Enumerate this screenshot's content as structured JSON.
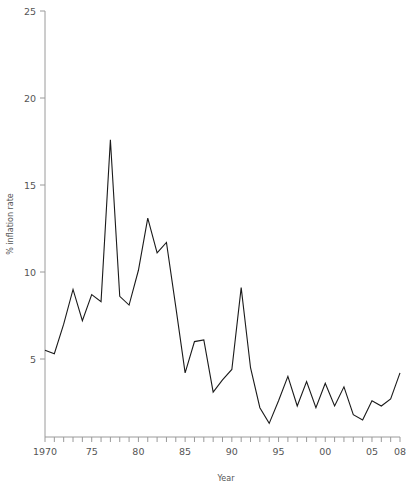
{
  "chart_data": {
    "type": "line",
    "title": "",
    "xlabel": "Year",
    "ylabel": "% inflation rate",
    "xlim": [
      1970,
      2008
    ],
    "ylim": [
      0.5,
      25
    ],
    "grid": false,
    "legend": null,
    "x_tick_values": [
      1970,
      1975,
      1980,
      1985,
      1990,
      1995,
      2000,
      2005,
      2008
    ],
    "x_tick_labels": [
      "1970",
      "75",
      "80",
      "85",
      "90",
      "95",
      "00",
      "05",
      "08"
    ],
    "x_minor_ticks_every": 1,
    "y_tick_values": [
      5,
      10,
      15,
      20,
      25
    ],
    "y_tick_labels": [
      "5",
      "10",
      "15",
      "20",
      "25"
    ],
    "series": [
      {
        "name": "% inflation rate",
        "color": "#1a1a1a",
        "x": [
          1970,
          1971,
          1972,
          1973,
          1974,
          1975,
          1976,
          1977,
          1978,
          1979,
          1980,
          1981,
          1982,
          1983,
          1984,
          1985,
          1986,
          1987,
          1988,
          1989,
          1990,
          1991,
          1992,
          1993,
          1994,
          1995,
          1996,
          1997,
          1998,
          1999,
          2000,
          2001,
          2002,
          2003,
          2004,
          2005,
          2006,
          2007,
          2008
        ],
        "values": [
          5.5,
          5.3,
          7.0,
          9.0,
          7.2,
          8.7,
          8.3,
          17.6,
          8.6,
          8.1,
          10.1,
          13.1,
          11.1,
          11.7,
          8.0,
          4.2,
          6.0,
          6.1,
          3.1,
          3.8,
          4.4,
          9.1,
          4.5,
          2.2,
          1.3,
          2.6,
          4.0,
          2.3,
          3.7,
          2.2,
          3.6,
          2.3,
          3.4,
          1.8,
          1.5,
          2.6,
          2.3,
          2.7,
          4.2
        ]
      }
    ]
  },
  "labels": {
    "y_axis_title": "% inflation rate",
    "x_axis_title": "Year"
  }
}
